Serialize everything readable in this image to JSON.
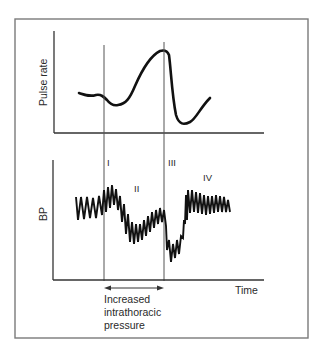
{
  "figure": {
    "top_panel": {
      "ylabel": "Pulse rate"
    },
    "bottom_panel": {
      "ylabel": "BP",
      "xlabel": "Time",
      "phases": [
        "I",
        "II",
        "III",
        "IV"
      ]
    },
    "annotation": {
      "lines": [
        "Increased",
        "intrathoracic",
        "pressure"
      ]
    },
    "colors": {
      "frame": "#7a7a7a",
      "axis": "#333333",
      "trace": "#111111",
      "background": "#ffffff"
    }
  }
}
